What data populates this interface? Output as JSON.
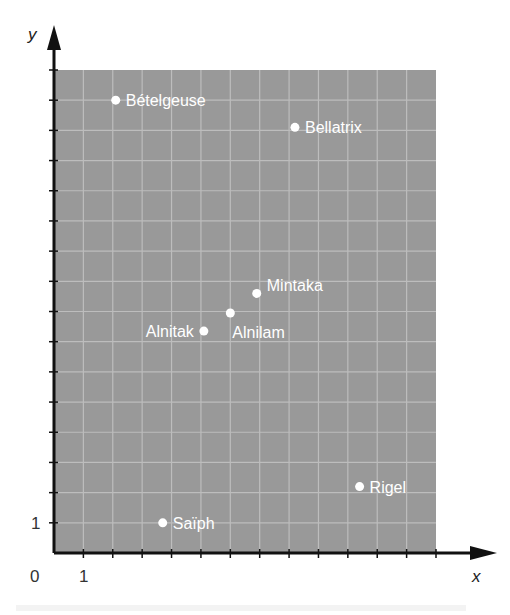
{
  "chart_data": {
    "type": "scatter",
    "title": "",
    "xlabel": "x",
    "ylabel": "y",
    "xlim": [
      0,
      13
    ],
    "ylim": [
      0,
      16
    ],
    "grid": true,
    "legend": null,
    "tick_labels": {
      "x": [
        "0",
        "1"
      ],
      "y": [
        "1"
      ]
    },
    "points": [
      {
        "name": "Bételgeuse",
        "x": 2.1,
        "y": 15.0,
        "label_side": "right"
      },
      {
        "name": "Bellatrix",
        "x": 8.2,
        "y": 14.1,
        "label_side": "right"
      },
      {
        "name": "Mintaka",
        "x": 6.9,
        "y": 8.6,
        "label_side": "right-up"
      },
      {
        "name": "Alnilam",
        "x": 6.0,
        "y": 7.95,
        "label_side": "below-right"
      },
      {
        "name": "Alnitak",
        "x": 5.1,
        "y": 7.35,
        "label_side": "left"
      },
      {
        "name": "Rigel",
        "x": 10.4,
        "y": 2.2,
        "label_side": "right"
      },
      {
        "name": "Saïph",
        "x": 3.7,
        "y": 1.0,
        "label_side": "right"
      }
    ]
  },
  "colors": {
    "plot_bg": "#999999",
    "grid": "#bdbdbd",
    "axis": "#111111",
    "point": "#ffffff",
    "label": "#ffffff"
  },
  "axis_labels": {
    "x": "x",
    "y": "y",
    "origin": "0",
    "x_one": "1",
    "y_one": "1"
  }
}
